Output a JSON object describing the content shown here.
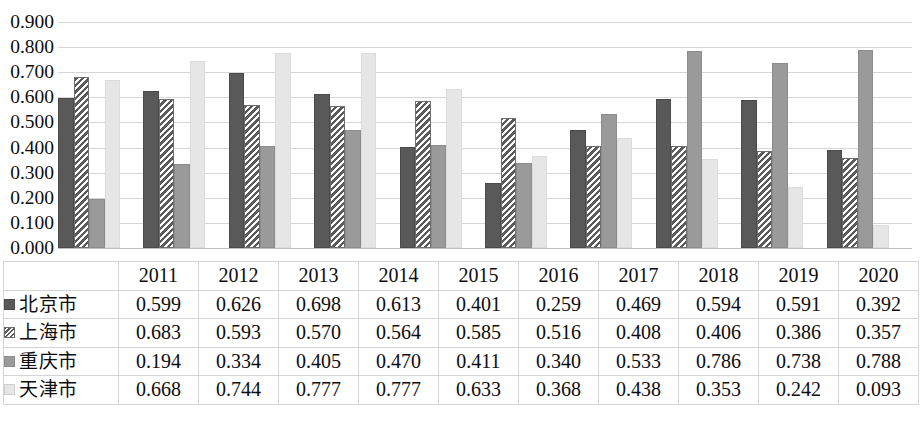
{
  "chart_data": {
    "type": "bar",
    "title": "",
    "subtitle": "",
    "xlabel": "",
    "ylabel": "",
    "categories": [
      "2011",
      "2012",
      "2013",
      "2014",
      "2015",
      "2016",
      "2017",
      "2018",
      "2019",
      "2020"
    ],
    "series": [
      {
        "name": "北京市",
        "style": "solid-dark-gray",
        "color": "#595959",
        "values": [
          0.599,
          0.626,
          0.698,
          0.613,
          0.401,
          0.259,
          0.469,
          0.594,
          0.591,
          0.392
        ]
      },
      {
        "name": "上海市",
        "style": "diagonal-hatch",
        "color": "#ffffff",
        "values": [
          0.683,
          0.593,
          0.57,
          0.564,
          0.585,
          0.516,
          0.408,
          0.406,
          0.386,
          0.357
        ]
      },
      {
        "name": "重庆市",
        "style": "solid-medium-gray",
        "color": "#9a9a9a",
        "values": [
          0.194,
          0.334,
          0.405,
          0.47,
          0.411,
          0.34,
          0.533,
          0.786,
          0.738,
          0.788
        ]
      },
      {
        "name": "天津市",
        "style": "solid-light-gray",
        "color": "#e6e6e6",
        "values": [
          0.668,
          0.744,
          0.777,
          0.777,
          0.633,
          0.368,
          0.438,
          0.353,
          0.242,
          0.093
        ]
      }
    ],
    "ylim": [
      0.0,
      0.9
    ],
    "ytick_step": 0.1,
    "ytick_labels": [
      "0.900",
      "0.800",
      "0.700",
      "0.600",
      "0.500",
      "0.400",
      "0.300",
      "0.200",
      "0.100",
      "0.000"
    ],
    "ytick_values": [
      0.9,
      0.8,
      0.7,
      0.6,
      0.5,
      0.4,
      0.3,
      0.2,
      0.1,
      0.0
    ],
    "grid": true,
    "legend_position": "data-table-row-headers",
    "value_format": "0.000",
    "has_data_table": true
  },
  "table": {
    "corner_label": "",
    "year_headers": [
      "2011",
      "2012",
      "2013",
      "2014",
      "2015",
      "2016",
      "2017",
      "2018",
      "2019",
      "2020"
    ],
    "rows": [
      {
        "series_name": "北京市",
        "swatch": "s0",
        "cells": [
          "0.599",
          "0.626",
          "0.698",
          "0.613",
          "0.401",
          "0.259",
          "0.469",
          "0.594",
          "0.591",
          "0.392"
        ]
      },
      {
        "series_name": "上海市",
        "swatch": "s1",
        "cells": [
          "0.683",
          "0.593",
          "0.570",
          "0.564",
          "0.585",
          "0.516",
          "0.408",
          "0.406",
          "0.386",
          "0.357"
        ]
      },
      {
        "series_name": "重庆市",
        "swatch": "s2",
        "cells": [
          "0.194",
          "0.334",
          "0.405",
          "0.470",
          "0.411",
          "0.340",
          "0.533",
          "0.786",
          "0.738",
          "0.788"
        ]
      },
      {
        "series_name": "天津市",
        "swatch": "s3",
        "cells": [
          "0.668",
          "0.744",
          "0.777",
          "0.777",
          "0.633",
          "0.368",
          "0.438",
          "0.353",
          "0.242",
          "0.093"
        ]
      }
    ]
  },
  "caption": {
    "text": ""
  }
}
